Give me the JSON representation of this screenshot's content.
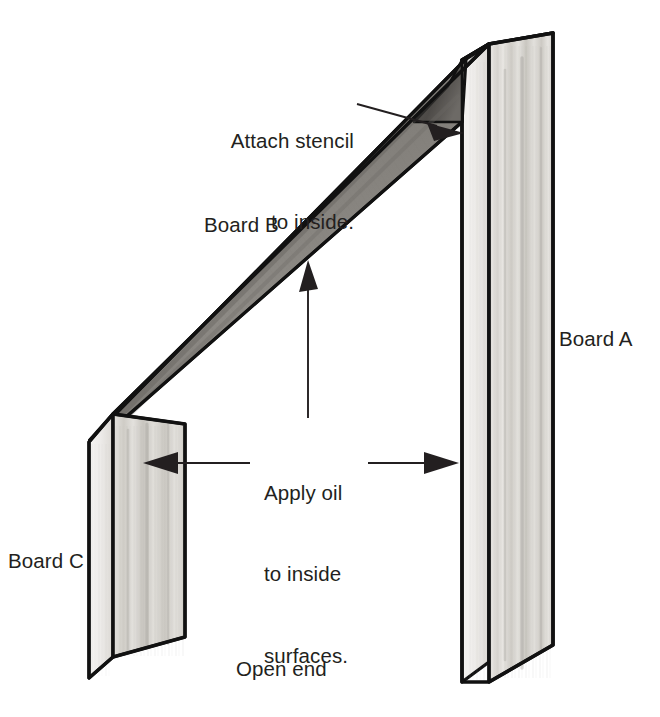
{
  "figure": {
    "background_color": "#ffffff",
    "ink_color": "#231f20"
  },
  "labels": {
    "board_a": "Board A",
    "board_b": "Board B",
    "board_c": "Board C",
    "open_end": "Open end",
    "attach_stencil_line1": "Attach stencil",
    "attach_stencil_line2": "to inside.",
    "apply_oil_line1": "Apply oil",
    "apply_oil_line2": "to inside",
    "apply_oil_line3": "surfaces."
  },
  "annotations": [
    {
      "name": "attach-stencil-callout",
      "text": "Attach stencil to inside.",
      "arrow": "diagonal-down-right",
      "points_to": "inside face of Board B near Board A"
    },
    {
      "name": "apply-oil-callout",
      "text": "Apply oil to inside surfaces.",
      "arrows": [
        "up-to-board-b",
        "left-to-board-c",
        "right-to-board-a"
      ],
      "points_to": "inside surfaces of Board A, Board B and Board C"
    }
  ],
  "parts": [
    {
      "name": "board-a",
      "label": "Board A",
      "orientation": "vertical-right"
    },
    {
      "name": "board-b",
      "label": "Board B",
      "orientation": "diagonal"
    },
    {
      "name": "board-c",
      "label": "Board C",
      "orientation": "vertical-left"
    }
  ],
  "colors": {
    "wood_light": "#e9e7e3",
    "wood_mid": "#cfccc7",
    "wood_edge": "#f4f3f1",
    "wood_shadow": "#8e8b86",
    "inside_dark": "#6f6c68",
    "outline": "#111111"
  }
}
